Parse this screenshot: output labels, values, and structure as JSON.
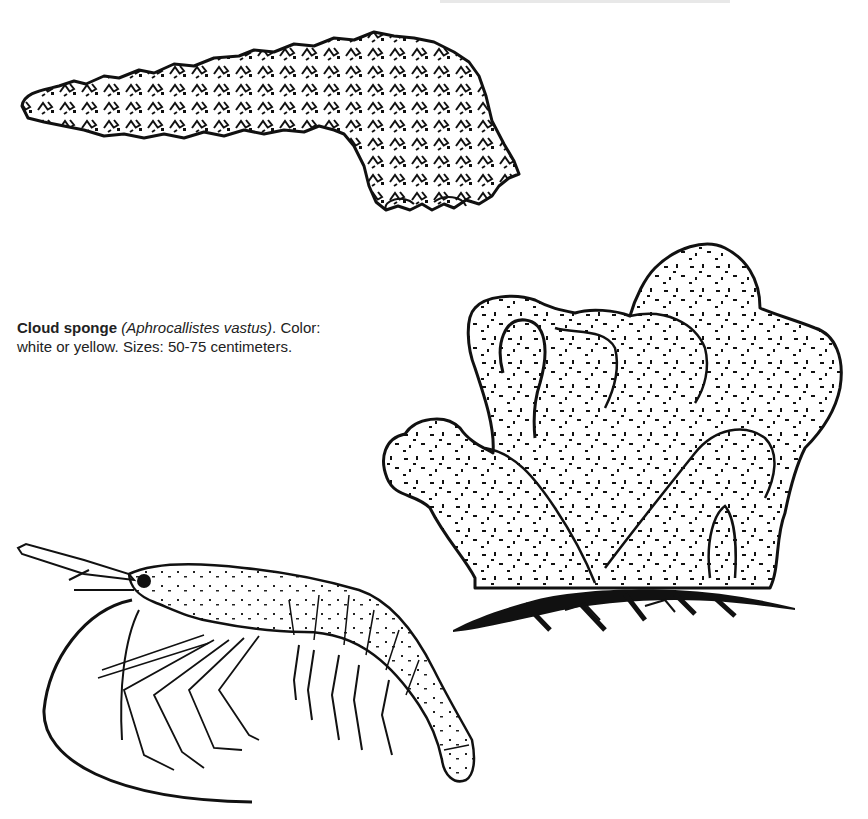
{
  "page": {
    "background": "#ffffff",
    "ink_color": "#111111"
  },
  "illustrations": [
    {
      "id": "sea-cucumber",
      "label": "elongated spiny sea cucumber illustration"
    },
    {
      "id": "cloud-sponge",
      "label": "cloud sponge illustration"
    },
    {
      "id": "shrimp",
      "label": "shrimp illustration"
    }
  ],
  "caption": {
    "common_name": "Cloud sponge",
    "scientific_name": "(Aphrocallistes vastus)",
    "after_name": ". Color:",
    "line2": "white or yellow. Sizes: 50-75 centimeters."
  }
}
